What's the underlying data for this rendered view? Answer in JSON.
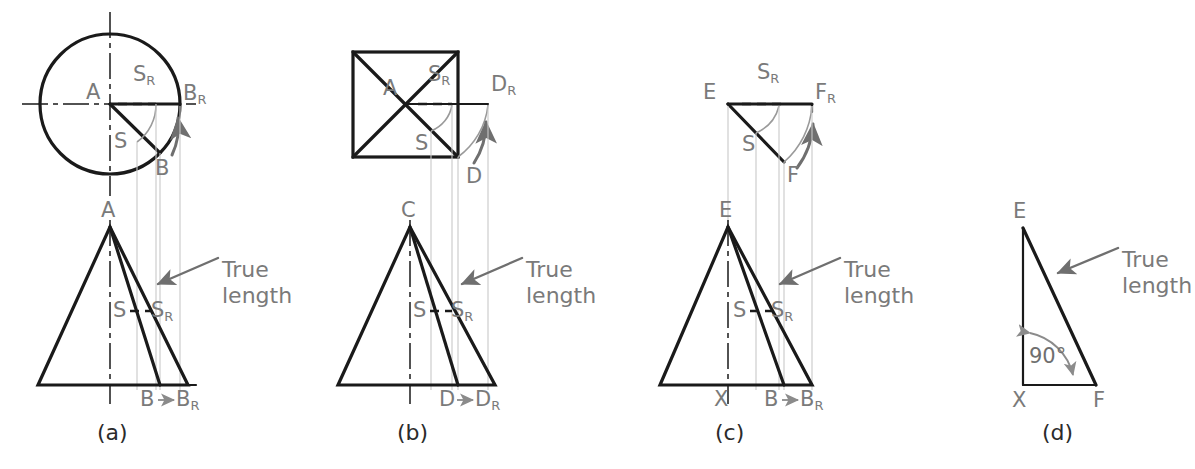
{
  "figure": {
    "colors": {
      "line": "#1a1a1a",
      "label": "#7a7a7a",
      "caption": "#2b2b2b",
      "projection": "#c9c9c9",
      "arrow": "#6f6f6f",
      "arc": "#9a9a9a"
    },
    "annotation_text": {
      "true_length": "True length",
      "right_angle": "90°"
    },
    "parts": [
      {
        "id": "a",
        "caption": "(a)",
        "top_view_shape": "circle",
        "labels": [
          {
            "name": "apex-center-a",
            "base": "A",
            "sub": ""
          },
          {
            "name": "s-rotated-top-a",
            "base": "S",
            "sub": "R"
          },
          {
            "name": "b-rotated-top-a",
            "base": "B",
            "sub": "R"
          },
          {
            "name": "s-top-a",
            "base": "S",
            "sub": ""
          },
          {
            "name": "b-top-a",
            "base": "B",
            "sub": ""
          }
        ],
        "front_view_labels": [
          {
            "name": "apex-front-a",
            "base": "A",
            "sub": ""
          },
          {
            "name": "s-front-a",
            "base": "S",
            "sub": ""
          },
          {
            "name": "s-rotated-front-a",
            "base": "S",
            "sub": "R"
          },
          {
            "name": "b-front-a",
            "base": "B",
            "sub": ""
          },
          {
            "name": "b-rotated-front-a",
            "base": "B",
            "sub": "R"
          }
        ],
        "true_length_note": "True length"
      },
      {
        "id": "b",
        "caption": "(b)",
        "top_view_shape": "square-with-diagonals",
        "labels": [
          {
            "name": "apex-center-b",
            "base": "A",
            "sub": ""
          },
          {
            "name": "s-rotated-top-b",
            "base": "S",
            "sub": "R"
          },
          {
            "name": "d-rotated-top-b",
            "base": "D",
            "sub": "R"
          },
          {
            "name": "s-top-b",
            "base": "S",
            "sub": ""
          },
          {
            "name": "d-top-b",
            "base": "D",
            "sub": ""
          }
        ],
        "front_view_labels": [
          {
            "name": "apex-front-b",
            "base": "C",
            "sub": ""
          },
          {
            "name": "s-front-b",
            "base": "S",
            "sub": ""
          },
          {
            "name": "s-rotated-front-b",
            "base": "S",
            "sub": "R"
          },
          {
            "name": "d-front-b",
            "base": "D",
            "sub": ""
          },
          {
            "name": "d-rotated-front-b",
            "base": "D",
            "sub": "R"
          }
        ],
        "true_length_note": "True length"
      },
      {
        "id": "c",
        "caption": "(c)",
        "top_view_shape": "triangle-wedge",
        "labels": [
          {
            "name": "e-top-c",
            "base": "E",
            "sub": ""
          },
          {
            "name": "s-rotated-top-c",
            "base": "S",
            "sub": "R"
          },
          {
            "name": "f-rotated-top-c",
            "base": "F",
            "sub": "R"
          },
          {
            "name": "s-top-c",
            "base": "S",
            "sub": ""
          },
          {
            "name": "f-top-c",
            "base": "F",
            "sub": ""
          }
        ],
        "front_view_labels": [
          {
            "name": "apex-front-c",
            "base": "E",
            "sub": ""
          },
          {
            "name": "s-front-c",
            "base": "S",
            "sub": ""
          },
          {
            "name": "s-rotated-front-c",
            "base": "S",
            "sub": "R"
          },
          {
            "name": "x-front-c",
            "base": "X",
            "sub": ""
          },
          {
            "name": "b-front-c",
            "base": "B",
            "sub": ""
          },
          {
            "name": "b-rotated-front-c",
            "base": "B",
            "sub": "R"
          }
        ],
        "true_length_note": "True length"
      },
      {
        "id": "d",
        "caption": "(d)",
        "top_view_shape": "none",
        "labels": [],
        "front_view_labels": [
          {
            "name": "e-vertex-d",
            "base": "E",
            "sub": ""
          },
          {
            "name": "x-vertex-d",
            "base": "X",
            "sub": ""
          },
          {
            "name": "f-vertex-d",
            "base": "F",
            "sub": ""
          }
        ],
        "angle_label": "90°",
        "true_length_note": "True length"
      }
    ]
  }
}
